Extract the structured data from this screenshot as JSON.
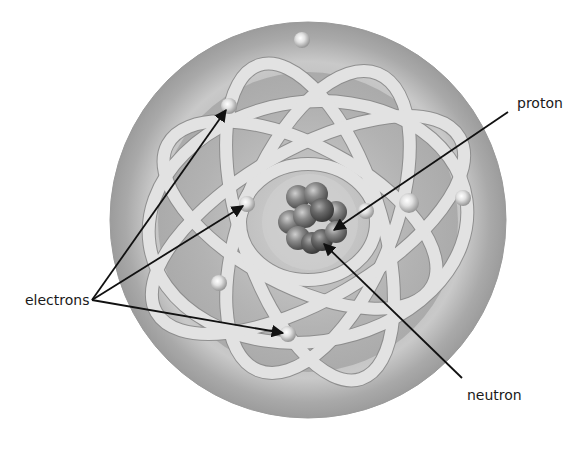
{
  "diagram": {
    "labels": {
      "electrons": "electrons",
      "proton": "proton",
      "neutron": "neutron"
    },
    "label_positions": {
      "electrons": {
        "x": 25,
        "y": 292
      },
      "proton": {
        "x": 517,
        "y": 95
      },
      "neutron": {
        "x": 467,
        "y": 387
      }
    },
    "colors": {
      "background": "#ffffff",
      "atom_outer": "#a8a8a8",
      "atom_rim_light": "#d8d8d8",
      "orbit_band": "#dcdcdc",
      "orbit_stroke": "#8a8a8a",
      "nucleus_particle": "#7a7a7a",
      "electron": "#f0f0f0",
      "arrow": "#111111",
      "text": "#1a1a1a"
    },
    "atom": {
      "cx": 308,
      "cy": 220,
      "r": 198
    },
    "nucleus": {
      "cx": 310,
      "cy": 222
    },
    "electrons": [
      {
        "x": 302,
        "y": 40
      },
      {
        "x": 229,
        "y": 106
      },
      {
        "x": 247,
        "y": 204
      },
      {
        "x": 366,
        "y": 211
      },
      {
        "x": 409,
        "y": 203
      },
      {
        "x": 463,
        "y": 198
      },
      {
        "x": 219,
        "y": 283
      },
      {
        "x": 288,
        "y": 334
      }
    ],
    "arrows": [
      {
        "name": "electron-arrow-1",
        "from": [
          92,
          300
        ],
        "to": [
          226,
          110
        ]
      },
      {
        "name": "electron-arrow-2",
        "from": [
          92,
          300
        ],
        "to": [
          243,
          206
        ]
      },
      {
        "name": "electron-arrow-3",
        "from": [
          92,
          300
        ],
        "to": [
          283,
          333
        ]
      },
      {
        "name": "proton-arrow",
        "from": [
          508,
          112
        ],
        "to": [
          334,
          230
        ]
      },
      {
        "name": "neutron-arrow",
        "from": [
          462,
          378
        ],
        "to": [
          324,
          244
        ]
      }
    ]
  }
}
